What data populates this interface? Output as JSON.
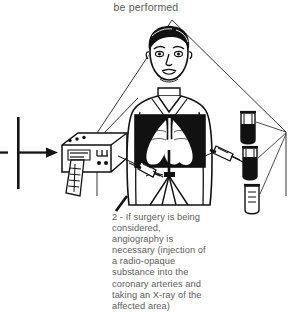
{
  "page": {
    "background_color": "#ffffff",
    "ink_color": "#0d0d0d",
    "text_color": "#5e5e5e",
    "width": 292,
    "height": 308
  },
  "header": {
    "clipped_line": "be performed"
  },
  "caption": {
    "number": "2",
    "full_text": "2 - If surgery is being considered, angiography is necessary (injection of a radio-opaque substance into the coronary arteries and taking an X-ray of the affected area)",
    "lines": [
      "2 - If surgery is being",
      "considered,",
      "angiography is",
      "necessary (injection of",
      "a radio-opaque",
      "substance into the",
      "coronary arteries and",
      "taking an X-ray of the",
      "affected area)"
    ]
  },
  "illustration": {
    "description": "Line drawing of a male patient torso with an X-ray window over the chest showing heart and lungs, a monitor device at left with a printed paper strip, syringes injecting contrast, and vials at right, all inside a triangular frame",
    "parts": {
      "patient": "patient-figure",
      "chest_window": "chest-xray-window",
      "monitor": "ecg-monitor-device",
      "paper_strip": "printout-strip",
      "syringe_left": "syringe-left",
      "syringe_right": "syringe-right",
      "vials": "contrast-vials",
      "arrow": "flow-arrow",
      "bar": "vertical-bar",
      "frame": "triangular-frame",
      "leader": "caption-leader-line"
    }
  }
}
